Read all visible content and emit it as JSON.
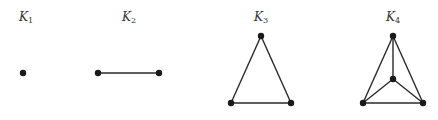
{
  "colors": {
    "edge": "#2a2a2a",
    "vertex": "#1a1a1a",
    "label": "#333333"
  },
  "graphs": [
    {
      "name": "K",
      "sub": "1",
      "label_pos": [
        26,
        10
      ],
      "vertices": [
        [
          23,
          73
        ]
      ],
      "edges": []
    },
    {
      "name": "K",
      "sub": "2",
      "label_pos": [
        129,
        10
      ],
      "vertices": [
        [
          98,
          73
        ],
        [
          159,
          73
        ]
      ],
      "edges": [
        [
          0,
          1
        ]
      ]
    },
    {
      "name": "K",
      "sub": "3",
      "label_pos": [
        261,
        10
      ],
      "vertices": [
        [
          261,
          36
        ],
        [
          231,
          103
        ],
        [
          291,
          103
        ]
      ],
      "edges": [
        [
          0,
          1
        ],
        [
          0,
          2
        ],
        [
          1,
          2
        ]
      ]
    },
    {
      "name": "K",
      "sub": "4",
      "label_pos": [
        393,
        10
      ],
      "vertices": [
        [
          393,
          36
        ],
        [
          393,
          79
        ],
        [
          363,
          103
        ],
        [
          423,
          103
        ]
      ],
      "edges": [
        [
          0,
          1
        ],
        [
          0,
          2
        ],
        [
          0,
          3
        ],
        [
          1,
          2
        ],
        [
          1,
          3
        ],
        [
          2,
          3
        ]
      ]
    }
  ]
}
